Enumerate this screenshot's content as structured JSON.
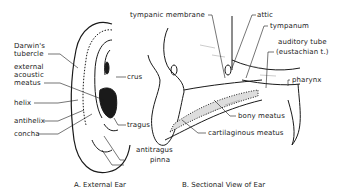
{
  "figure": {
    "panel_a": {
      "caption": "A. External Ear",
      "labels": {
        "darwins_tubercle_1": "Darwin's",
        "darwins_tubercle_2": "tubercle",
        "external_meatus_1": "external",
        "external_meatus_2": "acoustic",
        "external_meatus_3": "meatus",
        "helix": "helix",
        "antihelix": "antihelix",
        "concha": "concha",
        "crus": "crus",
        "tragus": "tragus",
        "antitragus": "antitragus",
        "pinna": "pinna"
      }
    },
    "panel_b": {
      "caption": "B. Sectional View of Ear",
      "labels": {
        "tympanic_membrane": "tympanic membrane",
        "attic": "attic",
        "tympanum": "tympanum",
        "auditory_tube_1": "auditory tube",
        "auditory_tube_2": "(eustachian t.)",
        "pharynx": "pharynx",
        "bony_meatus": "bony meatus",
        "cartilaginous_meatus": "cartilaginous meatus"
      }
    }
  }
}
